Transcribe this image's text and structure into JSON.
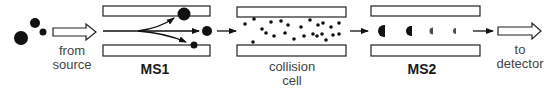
{
  "diagram": {
    "colors": {
      "ink": "#111111",
      "plate_fill": "#ffffff",
      "plate_stroke": "#222222",
      "label": "#444444"
    },
    "stages": [
      {
        "id": "source",
        "label_line1": "from",
        "label_line2": "source"
      },
      {
        "id": "ms1",
        "label": "MS1"
      },
      {
        "id": "collision_cell",
        "label_line1": "collision",
        "label_line2": "cell"
      },
      {
        "id": "ms2",
        "label": "MS2"
      },
      {
        "id": "detector",
        "label_line1": "to",
        "label_line2": "detector"
      }
    ],
    "source_ions": [
      {
        "cx": 21,
        "cy": 38,
        "r": 7
      },
      {
        "cx": 35,
        "cy": 23,
        "r": 5
      },
      {
        "cx": 43,
        "cy": 32,
        "r": 3.5
      }
    ],
    "ms1_selected_ions": [
      {
        "cx": 184,
        "cy": 14,
        "r": 6.5
      },
      {
        "cx": 207,
        "cy": 31,
        "r": 5
      },
      {
        "cx": 194,
        "cy": 45,
        "r": 3.5
      }
    ],
    "collision_gas_particles": [
      [
        245,
        24
      ],
      [
        254,
        19
      ],
      [
        262,
        29
      ],
      [
        266,
        33
      ],
      [
        271,
        22
      ],
      [
        274,
        36
      ],
      [
        281,
        21
      ],
      [
        285,
        33
      ],
      [
        288,
        25
      ],
      [
        294,
        39
      ],
      [
        301,
        27
      ],
      [
        304,
        36
      ],
      [
        310,
        20
      ],
      [
        313,
        34
      ],
      [
        318,
        25
      ],
      [
        317,
        36
      ],
      [
        322,
        34
      ],
      [
        323,
        23
      ],
      [
        326,
        40
      ],
      [
        331,
        27
      ],
      [
        333,
        35
      ],
      [
        339,
        23
      ],
      [
        339,
        34
      ],
      [
        253,
        42
      ]
    ],
    "ms2_fragments": [
      {
        "cx": 384,
        "cy": 31,
        "size": 6
      },
      {
        "cx": 411,
        "cy": 31,
        "size": 5
      },
      {
        "cx": 433,
        "cy": 31,
        "size": 3.5
      },
      {
        "cx": 456,
        "cy": 31,
        "size": 3
      }
    ]
  }
}
